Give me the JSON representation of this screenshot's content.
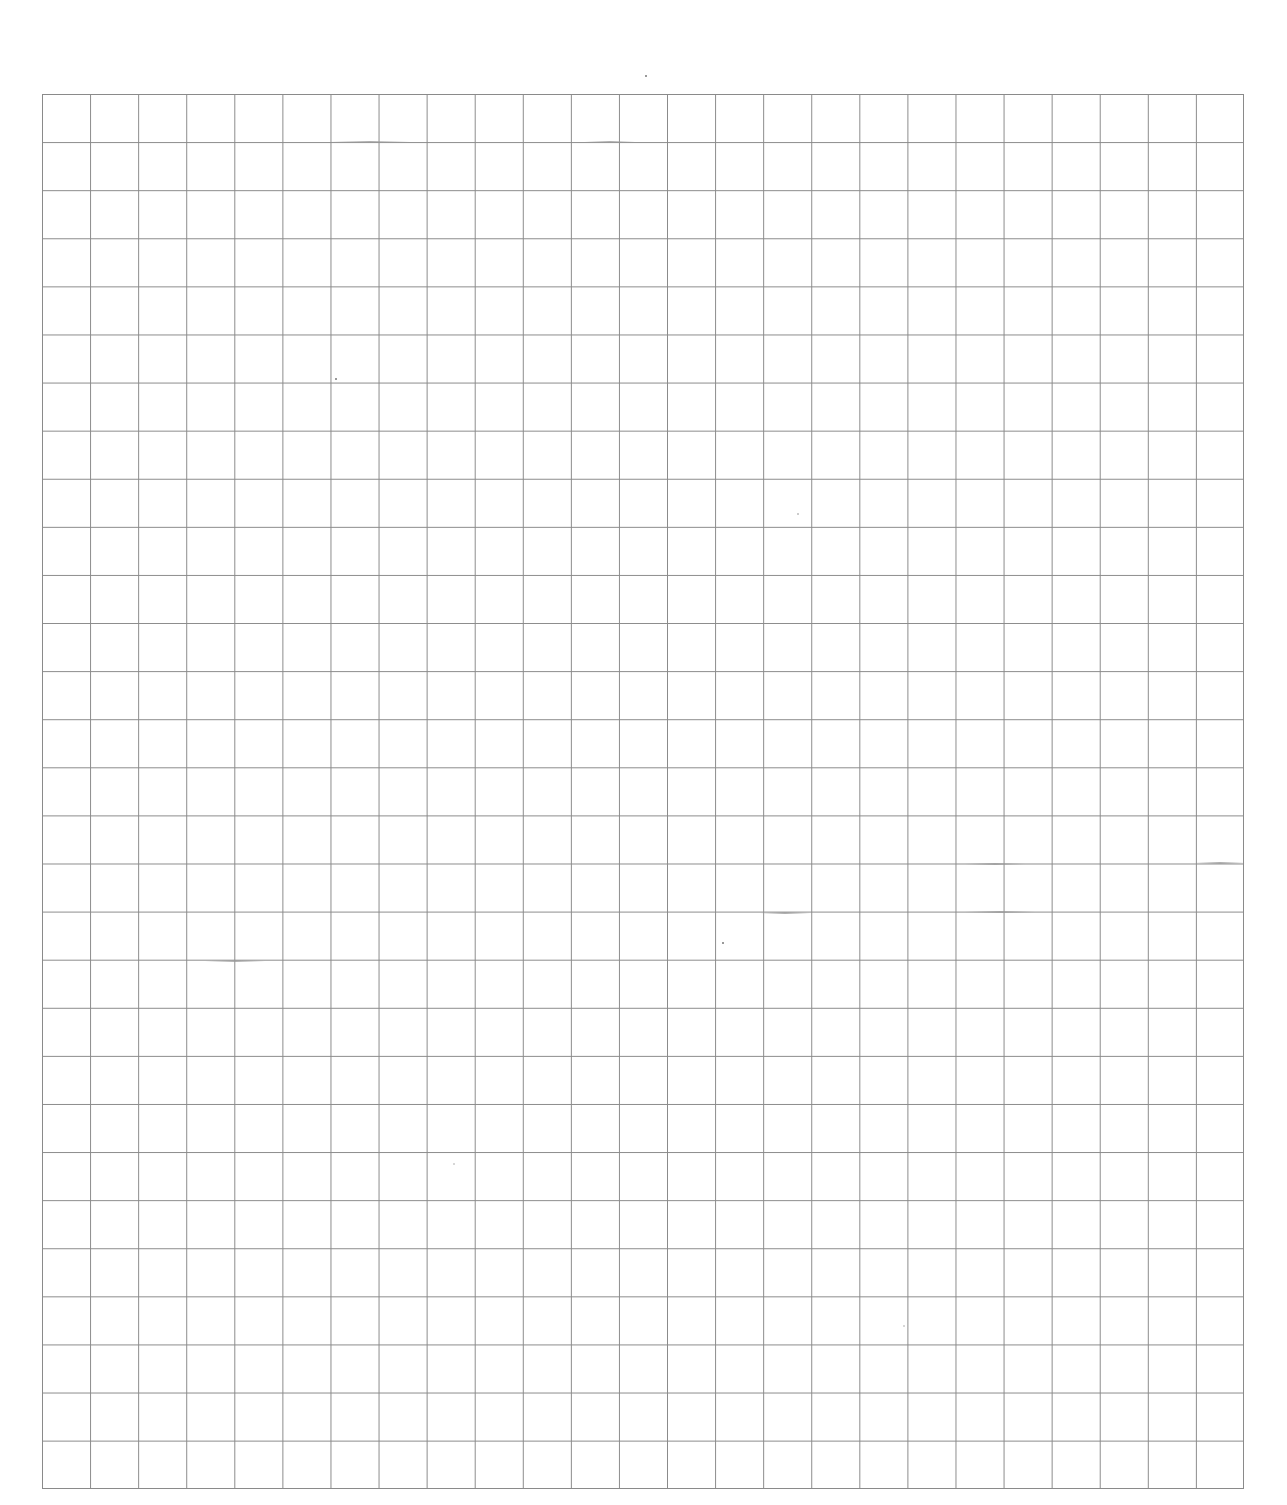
{
  "page": {
    "type": "blank grid paper",
    "background_color": "#ffffff",
    "grid": {
      "columns": 25,
      "rows": 29,
      "line_color": "#8a8a8a",
      "cell_size_px": 48
    }
  }
}
